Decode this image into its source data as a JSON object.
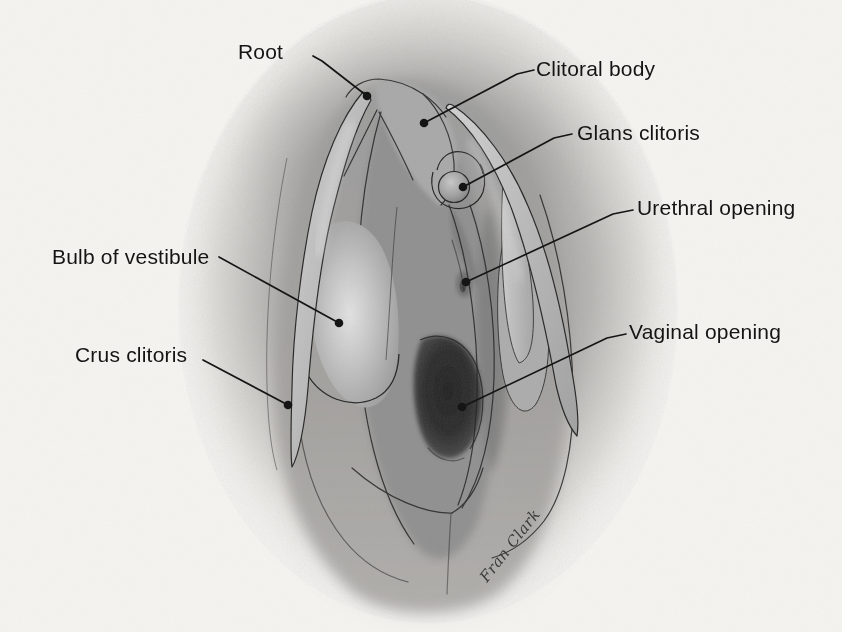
{
  "figure": {
    "type": "anatomical-illustration",
    "signature": "Fran Clark",
    "labels": {
      "root": "Root",
      "clitoral_body": "Clitoral body",
      "glans_clitoris": "Glans clitoris",
      "urethral_opening": "Urethral opening",
      "vaginal_opening": "Vaginal opening",
      "bulb_of_vestibule": "Bulb of vestibule",
      "crus_clitoris": "Crus clitoris"
    },
    "colors": {
      "paper": "#f5f4f1",
      "ink": "#141414",
      "airbrush_gray": "#909090",
      "structure_light_gray": "#c8c8c8",
      "opening_dark": "#2b2b2b"
    }
  }
}
